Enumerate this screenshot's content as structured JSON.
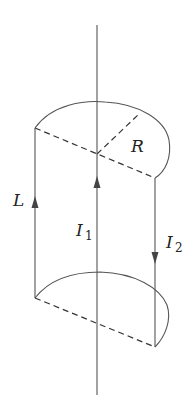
{
  "diagram": {
    "type": "physics-cylinder-current",
    "labels": {
      "radius": "R",
      "length": "L",
      "current1_main": "I",
      "current1_sub": "1",
      "current2_main": "I",
      "current2_sub": "2"
    },
    "colors": {
      "stroke": "#555555",
      "text": "#222222",
      "background": "#ffffff"
    }
  }
}
